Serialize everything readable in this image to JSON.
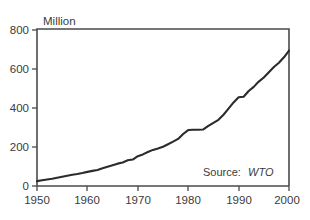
{
  "chart_data": {
    "type": "line",
    "title": "",
    "subtitle": "",
    "xlabel": "",
    "ylabel": "Million",
    "xlim": [
      1950,
      2000
    ],
    "ylim": [
      0,
      800
    ],
    "grid": false,
    "legend": null,
    "annotations": [
      {
        "name": "source-note",
        "prefix": "Source:",
        "emphasis": "WTO"
      }
    ],
    "xticks": [
      1950,
      1960,
      1970,
      1980,
      1990,
      2000
    ],
    "xtick_labels": [
      "1950",
      "1960",
      "1970",
      "1980",
      "1990",
      "2000"
    ],
    "yticks": [
      0,
      200,
      400,
      600,
      800
    ],
    "ytick_labels": [
      "0",
      "200",
      "400",
      "600",
      "800"
    ],
    "series": [
      {
        "name": "International tourist arrivals",
        "color": "#2b2b2b",
        "x": [
          1950,
          1951,
          1952,
          1953,
          1954,
          1955,
          1956,
          1957,
          1958,
          1959,
          1960,
          1961,
          1962,
          1963,
          1964,
          1965,
          1966,
          1967,
          1968,
          1969,
          1970,
          1971,
          1972,
          1973,
          1974,
          1975,
          1976,
          1977,
          1978,
          1979,
          1980,
          1981,
          1982,
          1983,
          1984,
          1985,
          1986,
          1987,
          1988,
          1989,
          1990,
          1991,
          1992,
          1993,
          1994,
          1995,
          1996,
          1997,
          1998,
          1999,
          2000
        ],
        "values": [
          25,
          29,
          33,
          37,
          42,
          47,
          52,
          57,
          61,
          66,
          72,
          77,
          82,
          90,
          98,
          106,
          114,
          120,
          131,
          135,
          152,
          161,
          173,
          184,
          191,
          200,
          213,
          226,
          240,
          265,
          285,
          287,
          287,
          288,
          306,
          322,
          337,
          363,
          394,
          426,
          452,
          455,
          484,
          505,
          532,
          553,
          580,
          606,
          628,
          656,
          690
        ]
      }
    ]
  },
  "axis": {
    "y_unit_label": "Million"
  },
  "source": {
    "prefix": "Source:",
    "organization": "WTO"
  }
}
